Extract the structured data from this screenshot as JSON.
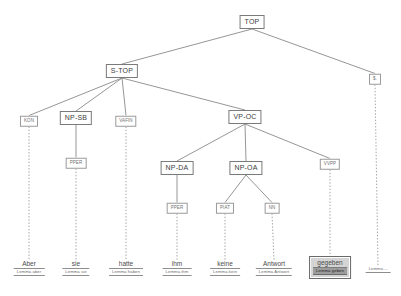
{
  "diagram": {
    "sentence": "Aber sie hatte ihm keine Antwort gegeben",
    "colors": {
      "background": "#ffffff",
      "edge": "#8a8a8a",
      "node_border": "#8a8a8a",
      "node_text": "#4d4d4d",
      "selection_fill": "#d4d4d4",
      "selection_highlight": "#9c9c9c"
    },
    "lemma_prefix": "Lemma"
  },
  "nodes": {
    "top": {
      "label": "TOP",
      "x": 252,
      "y": 22
    },
    "s_top": {
      "label": "S-TOP",
      "x": 122,
      "y": 71
    },
    "punct_phrase": {
      "label": "$.",
      "x": 375,
      "y": 79
    },
    "vp_oc": {
      "label": "VP-OC",
      "x": 245,
      "y": 117
    },
    "np_da": {
      "label": "NP-DA",
      "x": 177,
      "y": 168
    },
    "np_oa": {
      "label": "NP-OA",
      "x": 246,
      "y": 168
    },
    "np_sb": {
      "label": "NP-SB",
      "x": 76,
      "y": 118
    },
    "kon": {
      "label": "KON",
      "x": 29,
      "y": 121
    },
    "vafin": {
      "label": "VAFIN",
      "x": 126,
      "y": 121
    },
    "vvpp": {
      "label": "VVPP",
      "x": 330,
      "y": 164
    },
    "pper_sie": {
      "label": "PPER",
      "x": 76,
      "y": 163
    },
    "pper_ihm": {
      "label": "PPER",
      "x": 177,
      "y": 208
    },
    "piat": {
      "label": "PIAT",
      "x": 225,
      "y": 208
    },
    "nn": {
      "label": "NN",
      "x": 272,
      "y": 208
    }
  },
  "leaves": [
    {
      "id": "leaf-aber",
      "word": "Aber",
      "lemma": "Lemma aber",
      "x": 29,
      "y": 260,
      "selected": false
    },
    {
      "id": "leaf-sie",
      "word": "sie",
      "lemma": "Lemma sie",
      "x": 76,
      "y": 260,
      "selected": false
    },
    {
      "id": "leaf-hatte",
      "word": "hatte",
      "lemma": "Lemma haben",
      "x": 126,
      "y": 260,
      "selected": false
    },
    {
      "id": "leaf-ihm",
      "word": "ihm",
      "lemma": "Lemma ihm",
      "x": 177,
      "y": 260,
      "selected": false
    },
    {
      "id": "leaf-keine",
      "word": "keine",
      "lemma": "Lemma kein",
      "x": 225,
      "y": 260,
      "selected": false
    },
    {
      "id": "leaf-antwort",
      "word": "Antwort",
      "lemma": "Lemma Antwort",
      "x": 274,
      "y": 260,
      "selected": false
    },
    {
      "id": "leaf-gegeben",
      "word": "gegeben",
      "lemma": "Lemma geben",
      "x": 330,
      "y": 258,
      "selected": true
    },
    {
      "id": "leaf-punct",
      "word": "",
      "lemma": "Lemma --",
      "x": 378,
      "y": 262,
      "selected": false
    }
  ],
  "edges": {
    "solid": [
      {
        "from": "top",
        "to": "s_top"
      },
      {
        "from": "top",
        "to": "punct_phrase"
      },
      {
        "from": "s_top",
        "to": "kon"
      },
      {
        "from": "s_top",
        "to": "np_sb"
      },
      {
        "from": "s_top",
        "to": "vafin"
      },
      {
        "from": "s_top",
        "to": "vp_oc"
      },
      {
        "from": "np_sb",
        "to": "pper_sie"
      },
      {
        "from": "vp_oc",
        "to": "np_da"
      },
      {
        "from": "vp_oc",
        "to": "np_oa"
      },
      {
        "from": "vp_oc",
        "to": "vvpp"
      },
      {
        "from": "np_da",
        "to": "pper_ihm"
      },
      {
        "from": "np_oa",
        "to": "piat"
      },
      {
        "from": "np_oa",
        "to": "nn"
      }
    ],
    "dotted": [
      {
        "from": "kon",
        "to": "leaf-aber"
      },
      {
        "from": "pper_sie",
        "to": "leaf-sie"
      },
      {
        "from": "vafin",
        "to": "leaf-hatte"
      },
      {
        "from": "pper_ihm",
        "to": "leaf-ihm"
      },
      {
        "from": "piat",
        "to": "leaf-keine"
      },
      {
        "from": "nn",
        "to": "leaf-antwort"
      },
      {
        "from": "vvpp",
        "to": "leaf-gegeben"
      },
      {
        "from": "punct_phrase",
        "to": "leaf-punct"
      }
    ]
  }
}
